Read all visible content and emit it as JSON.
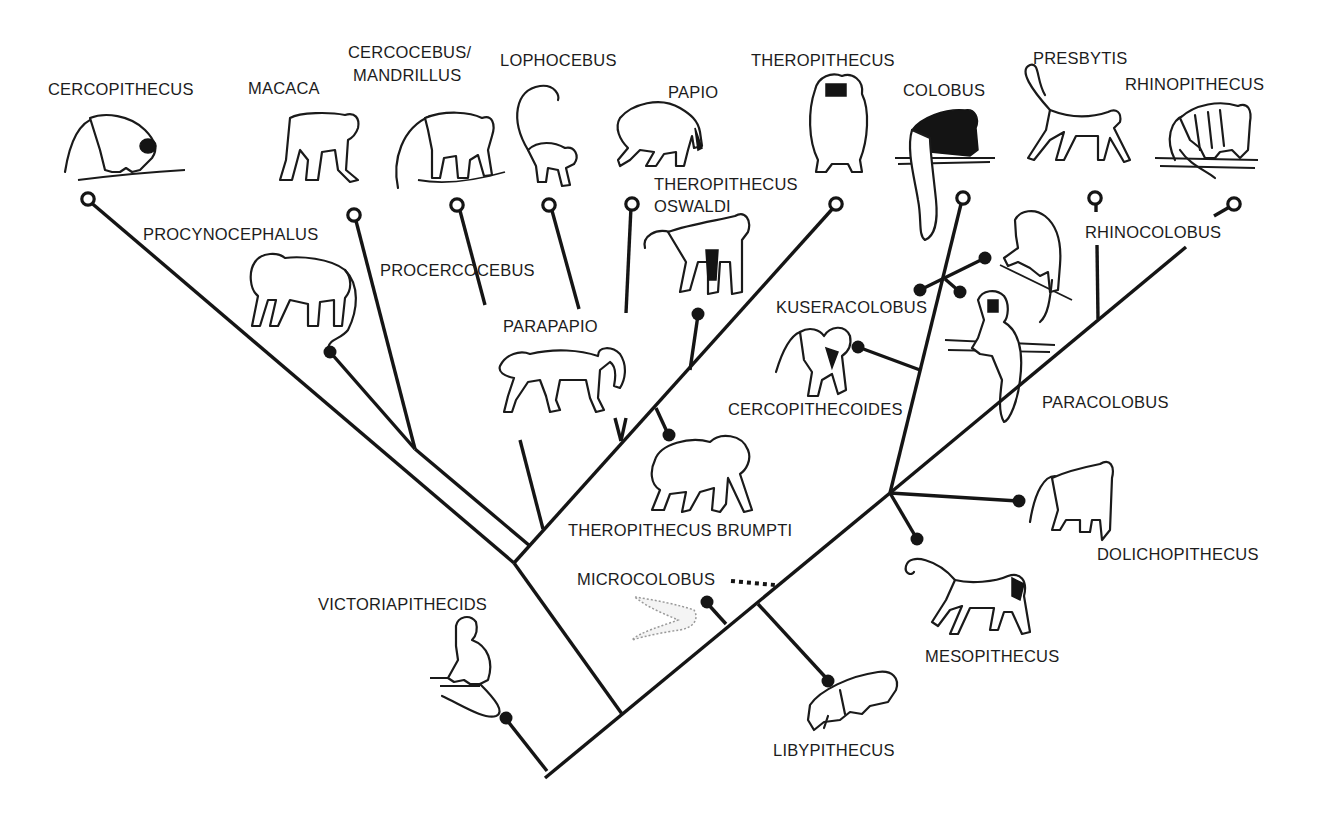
{
  "legend": {
    "extant_node": "open circle = living genus",
    "fossil_node": "filled circle = fossil genus"
  },
  "colors": {
    "ink": "#151515",
    "background": "#ffffff"
  },
  "labels": {
    "cercopithecus": "CERCOPITHECUS",
    "macaca": "MACACA",
    "cercocebus_1": "CERCOCEBUS/",
    "cercocebus_2": "MANDRILLUS",
    "lophocebus": "LOPHOCEBUS",
    "papio": "PAPIO",
    "theropithecus": "THEROPITHECUS",
    "colobus": "COLOBUS",
    "presbytis": "PRESBYTIS",
    "rhinopithecus": "RHINOPITHECUS",
    "procynocephalus": "PROCYNOCEPHALUS",
    "procercocebus": "PROCERCOCEBUS",
    "theropithecus_oswaldi_1": "THEROPITHECUS",
    "theropithecus_oswaldi_2": "OSWALDI",
    "parapapio": "PARAPAPIO",
    "rhinocolobus": "RHINOCOLOBUS",
    "kuseracolobus": "KUSERACOLOBUS",
    "cercopithecoides": "CERCOPITHECOIDES",
    "paracolobus": "PARACOLOBUS",
    "theropithecus_brumpti": "THEROPITHECUS BRUMPTI",
    "dolichopithecus": "DOLICHOPITHECUS",
    "microcolobus": "MICROCOLOBUS",
    "victoriapithecids": "VICTORIAPITHECIDS",
    "mesopithecus": "MESOPITHECUS",
    "libypithecus": "LIBYPITHECUS"
  },
  "label_positions": [
    {
      "key": "cercopithecus",
      "x": 48,
      "y": 95
    },
    {
      "key": "macaca",
      "x": 248,
      "y": 94
    },
    {
      "key": "cercocebus_1",
      "x": 348,
      "y": 58
    },
    {
      "key": "cercocebus_2",
      "x": 353,
      "y": 81
    },
    {
      "key": "lophocebus",
      "x": 500,
      "y": 66
    },
    {
      "key": "papio",
      "x": 668,
      "y": 98
    },
    {
      "key": "theropithecus",
      "x": 751,
      "y": 66
    },
    {
      "key": "colobus",
      "x": 903,
      "y": 96
    },
    {
      "key": "presbytis",
      "x": 1033,
      "y": 64
    },
    {
      "key": "rhinopithecus",
      "x": 1125,
      "y": 90
    },
    {
      "key": "procynocephalus",
      "x": 143,
      "y": 240
    },
    {
      "key": "procercocebus",
      "x": 380,
      "y": 276
    },
    {
      "key": "theropithecus_oswaldi_1",
      "x": 654,
      "y": 190
    },
    {
      "key": "theropithecus_oswaldi_2",
      "x": 654,
      "y": 212
    },
    {
      "key": "parapapio",
      "x": 503,
      "y": 332
    },
    {
      "key": "rhinocolobus",
      "x": 1085,
      "y": 238
    },
    {
      "key": "kuseracolobus",
      "x": 776,
      "y": 313
    },
    {
      "key": "cercopithecoides",
      "x": 728,
      "y": 415
    },
    {
      "key": "paracolobus",
      "x": 1042,
      "y": 408
    },
    {
      "key": "theropithecus_brumpti",
      "x": 568,
      "y": 536
    },
    {
      "key": "dolichopithecus",
      "x": 1097,
      "y": 560
    },
    {
      "key": "microcolobus",
      "x": 577,
      "y": 585
    },
    {
      "key": "victoriapithecids",
      "x": 318,
      "y": 610
    },
    {
      "key": "mesopithecus",
      "x": 925,
      "y": 662
    },
    {
      "key": "libypithecus",
      "x": 773,
      "y": 756
    }
  ],
  "branches": [
    {
      "name": "trunk-root",
      "x1": 545,
      "y1": 778,
      "x2": 890,
      "y2": 493
    },
    {
      "name": "colobine-to-colobus",
      "x1": 890,
      "y1": 493,
      "x2": 962,
      "y2": 200
    },
    {
      "name": "colobine-to-rhinopithecus",
      "x1": 890,
      "y1": 493,
      "x2": 1186,
      "y2": 247
    },
    {
      "name": "rhinocolobus-connector",
      "x1": 1098,
      "y1": 319,
      "x2": 1097,
      "y2": 245
    },
    {
      "name": "presbytis-stub",
      "x1": 1096,
      "y1": 200,
      "x2": 1096,
      "y2": 212
    },
    {
      "name": "rhinopithecus-stub",
      "x1": 1214,
      "y1": 216,
      "x2": 1233,
      "y2": 205
    },
    {
      "name": "dolichopithecus-stem",
      "x1": 890,
      "y1": 493,
      "x2": 1018,
      "y2": 501
    },
    {
      "name": "mesopithecus-stem",
      "x1": 890,
      "y1": 493,
      "x2": 917,
      "y2": 539
    },
    {
      "name": "cercopithecoides-stem",
      "x1": 920,
      "y1": 370,
      "x2": 858,
      "y2": 347
    },
    {
      "name": "kuseracolobus-x1",
      "x1": 920,
      "y1": 290,
      "x2": 985,
      "y2": 258
    },
    {
      "name": "kuseracolobus-x2",
      "x1": 945,
      "y1": 279,
      "x2": 960,
      "y2": 292
    },
    {
      "name": "libypithecus-stem",
      "x1": 758,
      "y1": 604,
      "x2": 828,
      "y2": 680
    },
    {
      "name": "microcolobus-stem",
      "x1": 726,
      "y1": 624,
      "x2": 707,
      "y2": 603
    },
    {
      "name": "victoriapithecid-stem",
      "x1": 547,
      "y1": 771,
      "x2": 506,
      "y2": 719
    },
    {
      "name": "cercopithecine-stem",
      "x1": 622,
      "y1": 714,
      "x2": 514,
      "y2": 563
    },
    {
      "name": "cerco-left-outer",
      "x1": 514,
      "y1": 563,
      "x2": 88,
      "y2": 200
    },
    {
      "name": "cerco-left-inner",
      "x1": 530,
      "y1": 546,
      "x2": 415,
      "y2": 449
    },
    {
      "name": "macaca-stem",
      "x1": 415,
      "y1": 449,
      "x2": 355,
      "y2": 217
    },
    {
      "name": "procynocephalus-stem",
      "x1": 415,
      "y1": 449,
      "x2": 330,
      "y2": 352
    },
    {
      "name": "papionin-main",
      "x1": 514,
      "y1": 563,
      "x2": 835,
      "y2": 206
    },
    {
      "name": "procercocebus-stub",
      "x1": 543,
      "y1": 529,
      "x2": 520,
      "y2": 440
    },
    {
      "name": "cercocebus-stem",
      "x1": 485,
      "y1": 305,
      "x2": 459,
      "y2": 207
    },
    {
      "name": "lophocebus-stem",
      "x1": 579,
      "y1": 309,
      "x2": 551,
      "y2": 207
    },
    {
      "name": "papio-stem",
      "x1": 626,
      "y1": 313,
      "x2": 631,
      "y2": 207
    },
    {
      "name": "parapapio-v-left",
      "x1": 615,
      "y1": 418,
      "x2": 621,
      "y2": 441
    },
    {
      "name": "parapapio-v-right",
      "x1": 626,
      "y1": 418,
      "x2": 621,
      "y2": 441
    },
    {
      "name": "brumpti-stem",
      "x1": 656,
      "y1": 408,
      "x2": 668,
      "y2": 434
    },
    {
      "name": "oswaldi-stem",
      "x1": 690,
      "y1": 370,
      "x2": 698,
      "y2": 315
    }
  ],
  "extant_nodes": [
    {
      "genus": "Cercopithecus",
      "cx": 88,
      "cy": 199
    },
    {
      "genus": "Macaca",
      "cx": 354,
      "cy": 215
    },
    {
      "genus": "Cercocebus/Mandrillus",
      "cx": 457,
      "cy": 205
    },
    {
      "genus": "Lophocebus",
      "cx": 549,
      "cy": 205
    },
    {
      "genus": "Papio",
      "cx": 632,
      "cy": 204
    },
    {
      "genus": "Theropithecus",
      "cx": 836,
      "cy": 204
    },
    {
      "genus": "Colobus",
      "cx": 963,
      "cy": 198
    },
    {
      "genus": "Presbytis",
      "cx": 1095,
      "cy": 198
    },
    {
      "genus": "Rhinopithecus",
      "cx": 1234,
      "cy": 204
    }
  ],
  "fossil_nodes": [
    {
      "genus": "Procynocephalus",
      "cx": 330,
      "cy": 352
    },
    {
      "genus": "Theropithecus oswaldi",
      "cx": 698,
      "cy": 314
    },
    {
      "genus": "Theropithecus brumpti",
      "cx": 669,
      "cy": 435
    },
    {
      "genus": "Kuseracolobus a",
      "cx": 985,
      "cy": 258
    },
    {
      "genus": "Kuseracolobus b",
      "cx": 920,
      "cy": 290
    },
    {
      "genus": "Kuseracolobus c",
      "cx": 960,
      "cy": 292
    },
    {
      "genus": "Cercopithecoides",
      "cx": 858,
      "cy": 347
    },
    {
      "genus": "Dolichopithecus",
      "cx": 1019,
      "cy": 501
    },
    {
      "genus": "Mesopithecus",
      "cx": 917,
      "cy": 539
    },
    {
      "genus": "Microcolobus",
      "cx": 707,
      "cy": 602
    },
    {
      "genus": "Libypithecus",
      "cx": 828,
      "cy": 681
    },
    {
      "genus": "Victoriapithecids",
      "cx": 506,
      "cy": 718
    }
  ],
  "dotted_links": [
    {
      "name": "microcolobus-dots",
      "x1": 731,
      "y1": 581,
      "x2": 775,
      "y2": 585
    }
  ]
}
